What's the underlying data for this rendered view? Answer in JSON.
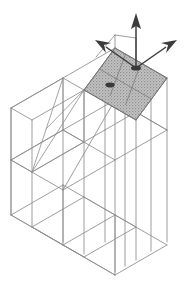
{
  "figure": {
    "title": "Isometric wireframe of a multi-storey structural frame",
    "background_color": "#ffffff",
    "line_color": "#8d8d8d",
    "dark_line_color": "#6f6f6f",
    "slab_fill_color": "#b4b4b4",
    "slab_edge_color": "#7a7a7a",
    "arrow_color": "#3c3c3c",
    "node_color": "#3a3a3a",
    "width_px": 187,
    "height_px": 292
  },
  "structure": {
    "name": "space-frame",
    "storeys": 3,
    "bays_x": 2,
    "bays_y": 2,
    "has_roof_diaphragm": true,
    "has_x_bracing": true,
    "bracing_location": "upper-left-bay",
    "projection": "isometric"
  },
  "roof_slab": {
    "name": "rigid-roof-diaphragm",
    "shading": "stipple",
    "grid_divisions_x": 2,
    "grid_divisions_y": 2
  },
  "loads": {
    "vertical": {
      "name": "vertical-load-arrow",
      "direction": "up",
      "label": ""
    },
    "left": {
      "name": "left-load-arrow",
      "direction": "left-down",
      "label": ""
    },
    "right": {
      "name": "right-load-arrow",
      "direction": "right-down",
      "label": ""
    }
  },
  "nodes": [
    {
      "name": "roof-load-node",
      "label": ""
    },
    {
      "name": "roof-interior-node",
      "label": ""
    }
  ],
  "caption": {
    "text": ""
  }
}
